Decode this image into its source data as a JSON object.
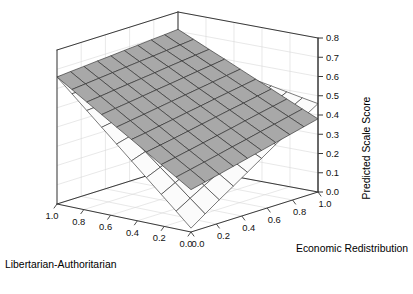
{
  "figure": {
    "background_color": "#ffffff",
    "box_line_color": "#3a3a3a",
    "grid_line_color": "#d9d9d9",
    "mesh_line_color": "#2b2b2b",
    "surface_light_color": "#fbfbfb",
    "surface_gray_color": "#a8a8a8"
  },
  "axes": {
    "z": {
      "title": "Predicted Scale Score",
      "ticks": [
        "0.0",
        "0.1",
        "0.2",
        "0.3",
        "0.4",
        "0.5",
        "0.6",
        "0.7",
        "0.8"
      ],
      "min": 0.0,
      "max": 0.8,
      "orientation": "vertical-right"
    },
    "x": {
      "title": "Libertarian-Authoritarian",
      "ticks": [
        "1.0",
        "0.8",
        "0.6",
        "0.4",
        "0.2",
        "0.0"
      ],
      "min": 0.0,
      "max": 1.0,
      "direction": "descending-left-to-right"
    },
    "y": {
      "title": "Economic Redistribution",
      "ticks": [
        "0.0",
        "0.2",
        "0.4",
        "0.6",
        "0.8",
        "1.0"
      ],
      "min": 0.0,
      "max": 1.0,
      "direction": "ascending-left-to-right"
    }
  },
  "caption_cut": "",
  "chart_data": {
    "type": "surface",
    "title": "",
    "xlabel": "Libertarian-Authoritarian",
    "ylabel": "Economic Redistribution",
    "zlabel": "Predicted Scale Score",
    "xlim": [
      0.0,
      1.0
    ],
    "ylim": [
      0.0,
      1.0
    ],
    "zlim": [
      0.0,
      0.8
    ],
    "grid": true,
    "legend": "none",
    "mesh_divisions": 10,
    "series": [
      {
        "name": "light-surface",
        "fill": "#fbfbfb",
        "description": "Near-planar surface, high at the Libertarian-Authoritarian=1.0 / Economic Redistribution=0.0 corner and descending toward low values; dips to a low front vertex.",
        "corners": {
          "x1_y0": 0.66,
          "x0_y0": 0.02,
          "x1_y1": 0.6,
          "x0_y1": 0.31
        },
        "grid_z": [
          [
            0.66,
            0.653,
            0.646,
            0.64,
            0.633,
            0.626,
            0.62,
            0.613,
            0.606,
            0.6
          ],
          [
            0.589,
            0.588,
            0.588,
            0.587,
            0.587,
            0.586,
            0.586,
            0.585,
            0.585,
            0.584
          ],
          [
            0.518,
            0.524,
            0.53,
            0.535,
            0.541,
            0.546,
            0.552,
            0.557,
            0.563,
            0.568
          ],
          [
            0.447,
            0.459,
            0.471,
            0.483,
            0.494,
            0.506,
            0.518,
            0.53,
            0.541,
            0.553
          ],
          [
            0.376,
            0.395,
            0.413,
            0.43,
            0.448,
            0.466,
            0.484,
            0.502,
            0.52,
            0.537
          ],
          [
            0.305,
            0.33,
            0.354,
            0.378,
            0.402,
            0.427,
            0.451,
            0.475,
            0.499,
            0.521
          ],
          [
            0.234,
            0.265,
            0.296,
            0.326,
            0.356,
            0.387,
            0.417,
            0.447,
            0.477,
            0.506
          ],
          [
            0.163,
            0.201,
            0.238,
            0.274,
            0.31,
            0.347,
            0.383,
            0.419,
            0.456,
            0.49
          ],
          [
            0.092,
            0.136,
            0.179,
            0.221,
            0.264,
            0.307,
            0.349,
            0.392,
            0.435,
            0.474
          ],
          [
            0.02,
            0.071,
            0.121,
            0.169,
            0.218,
            0.267,
            0.316,
            0.364,
            0.413,
            0.459
          ]
        ]
      },
      {
        "name": "gray-surface",
        "fill": "#a8a8a8",
        "description": "Planar surface sharing the high left corner with the light surface, sloping down more steeply toward the front; right corner lands near 0.33 on the z-axis.",
        "corners": {
          "x1_y0": 0.66,
          "x0_y0": 0.22,
          "x1_y1": 0.71,
          "x0_y1": 0.33
        },
        "grid_z": [
          [
            0.66,
            0.666,
            0.671,
            0.677,
            0.682,
            0.688,
            0.693,
            0.699,
            0.704,
            0.71
          ],
          [
            0.611,
            0.618,
            0.625,
            0.632,
            0.639,
            0.646,
            0.652,
            0.659,
            0.666,
            0.673
          ],
          [
            0.562,
            0.57,
            0.579,
            0.587,
            0.595,
            0.603,
            0.612,
            0.62,
            0.628,
            0.636
          ],
          [
            0.513,
            0.523,
            0.532,
            0.542,
            0.552,
            0.561,
            0.571,
            0.581,
            0.59,
            0.6
          ],
          [
            0.464,
            0.475,
            0.486,
            0.497,
            0.508,
            0.519,
            0.53,
            0.541,
            0.552,
            0.563
          ],
          [
            0.416,
            0.427,
            0.44,
            0.452,
            0.465,
            0.477,
            0.49,
            0.502,
            0.514,
            0.526
          ],
          [
            0.367,
            0.38,
            0.393,
            0.407,
            0.421,
            0.435,
            0.449,
            0.462,
            0.476,
            0.49
          ],
          [
            0.318,
            0.332,
            0.347,
            0.362,
            0.377,
            0.392,
            0.408,
            0.423,
            0.438,
            0.453
          ],
          [
            0.269,
            0.285,
            0.301,
            0.317,
            0.334,
            0.35,
            0.367,
            0.383,
            0.4,
            0.416
          ],
          [
            0.22,
            0.237,
            0.254,
            0.272,
            0.29,
            0.308,
            0.326,
            0.344,
            0.362,
            0.38
          ]
        ]
      }
    ]
  }
}
